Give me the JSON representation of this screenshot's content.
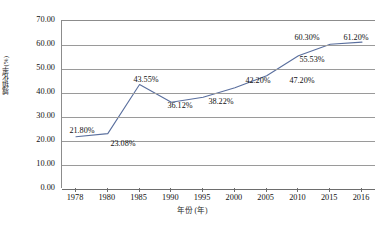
{
  "chart_data": {
    "type": "line",
    "title": "",
    "xlabel": "年份 (年)",
    "ylabel": "城镇化率(%)",
    "categories": [
      "1978",
      "1980",
      "1985",
      "1990",
      "1995",
      "2000",
      "2005",
      "2010",
      "2015",
      "2016"
    ],
    "values": [
      21.8,
      23.08,
      43.55,
      36.12,
      38.22,
      42.2,
      47.2,
      55.53,
      60.3,
      61.2
    ],
    "point_labels": [
      "21.80%",
      "23.08%",
      "43.55%",
      "36.12%",
      "38.22%",
      "42.20%",
      "47.20%",
      "55.53%",
      "60.30%",
      "61.20%"
    ],
    "ylim": [
      0,
      70
    ],
    "ytick_step": 10,
    "ytick_labels": [
      "0.00",
      "10.00",
      "20.00",
      "30.00",
      "40.00",
      "50.00",
      "60.00",
      "70.00"
    ],
    "grid": true,
    "grid_axis": "y",
    "legend": "none",
    "series_color": "#5a6f9e",
    "grid_color": "#9a9a9a",
    "axis_color": "#6d6d6d",
    "label_color": "#111111"
  },
  "label_positions": [
    {
      "text": "21.80%",
      "x": 82,
      "y": 131
    },
    {
      "text": "23.08%",
      "x": 123,
      "y": 144
    },
    {
      "text": "43.55%",
      "x": 146,
      "y": 80
    },
    {
      "text": "36.12%",
      "x": 180,
      "y": 106
    },
    {
      "text": "38.22%",
      "x": 221,
      "y": 102
    },
    {
      "text": "42.20%",
      "x": 258,
      "y": 81
    },
    {
      "text": "47.20%",
      "x": 302,
      "y": 81
    },
    {
      "text": "55.53%",
      "x": 312,
      "y": 60
    },
    {
      "text": "60.30%",
      "x": 307,
      "y": 38
    },
    {
      "text": "61.20%",
      "x": 356,
      "y": 38
    }
  ],
  "figure": {
    "caption": ""
  }
}
